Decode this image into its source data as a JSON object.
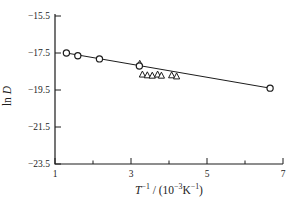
{
  "figure": {
    "background": "#ffffff",
    "ink": "#1c1c1c"
  },
  "chart_data": {
    "type": "scatter",
    "title": "",
    "xlabel": "T⁻¹ / (10⁻³K⁻¹)",
    "ylabel": "ln D",
    "xlim": [
      1,
      7
    ],
    "ylim": [
      -23.5,
      -15.5
    ],
    "x_major_ticks": [
      1,
      3,
      5,
      7
    ],
    "x_minor_ticks": [
      2,
      4,
      6
    ],
    "y_ticks": [
      -15.5,
      -17.5,
      -19.5,
      -21.5,
      -23.5
    ],
    "grid": false,
    "legend": false,
    "series": [
      {
        "name": "circle-markers",
        "marker": "circle",
        "points": [
          [
            1.3,
            -17.5
          ],
          [
            1.6,
            -17.65
          ],
          [
            2.17,
            -17.82
          ],
          [
            3.22,
            -18.2
          ],
          [
            6.66,
            -19.4
          ]
        ]
      },
      {
        "name": "triangle-markers",
        "marker": "triangle",
        "points": [
          [
            3.23,
            -18.08
          ],
          [
            3.3,
            -18.66
          ],
          [
            3.43,
            -18.7
          ],
          [
            3.56,
            -18.72
          ],
          [
            3.7,
            -18.66
          ],
          [
            3.8,
            -18.72
          ],
          [
            4.07,
            -18.7
          ],
          [
            4.2,
            -18.76
          ]
        ]
      }
    ],
    "fit_line": {
      "from": [
        1.3,
        -17.5
      ],
      "to": [
        6.66,
        -19.4
      ]
    }
  },
  "labels": {
    "xlabel_parts": [
      {
        "t": "T",
        "italic": true
      },
      {
        "t": "−1",
        "sup": true
      },
      {
        "t": " / (10"
      },
      {
        "t": "−3",
        "sup": true
      },
      {
        "t": "K"
      },
      {
        "t": "−1",
        "sup": true
      },
      {
        "t": ")"
      }
    ],
    "ylabel_parts": [
      {
        "t": "ln "
      },
      {
        "t": "D",
        "italic": true
      }
    ]
  }
}
